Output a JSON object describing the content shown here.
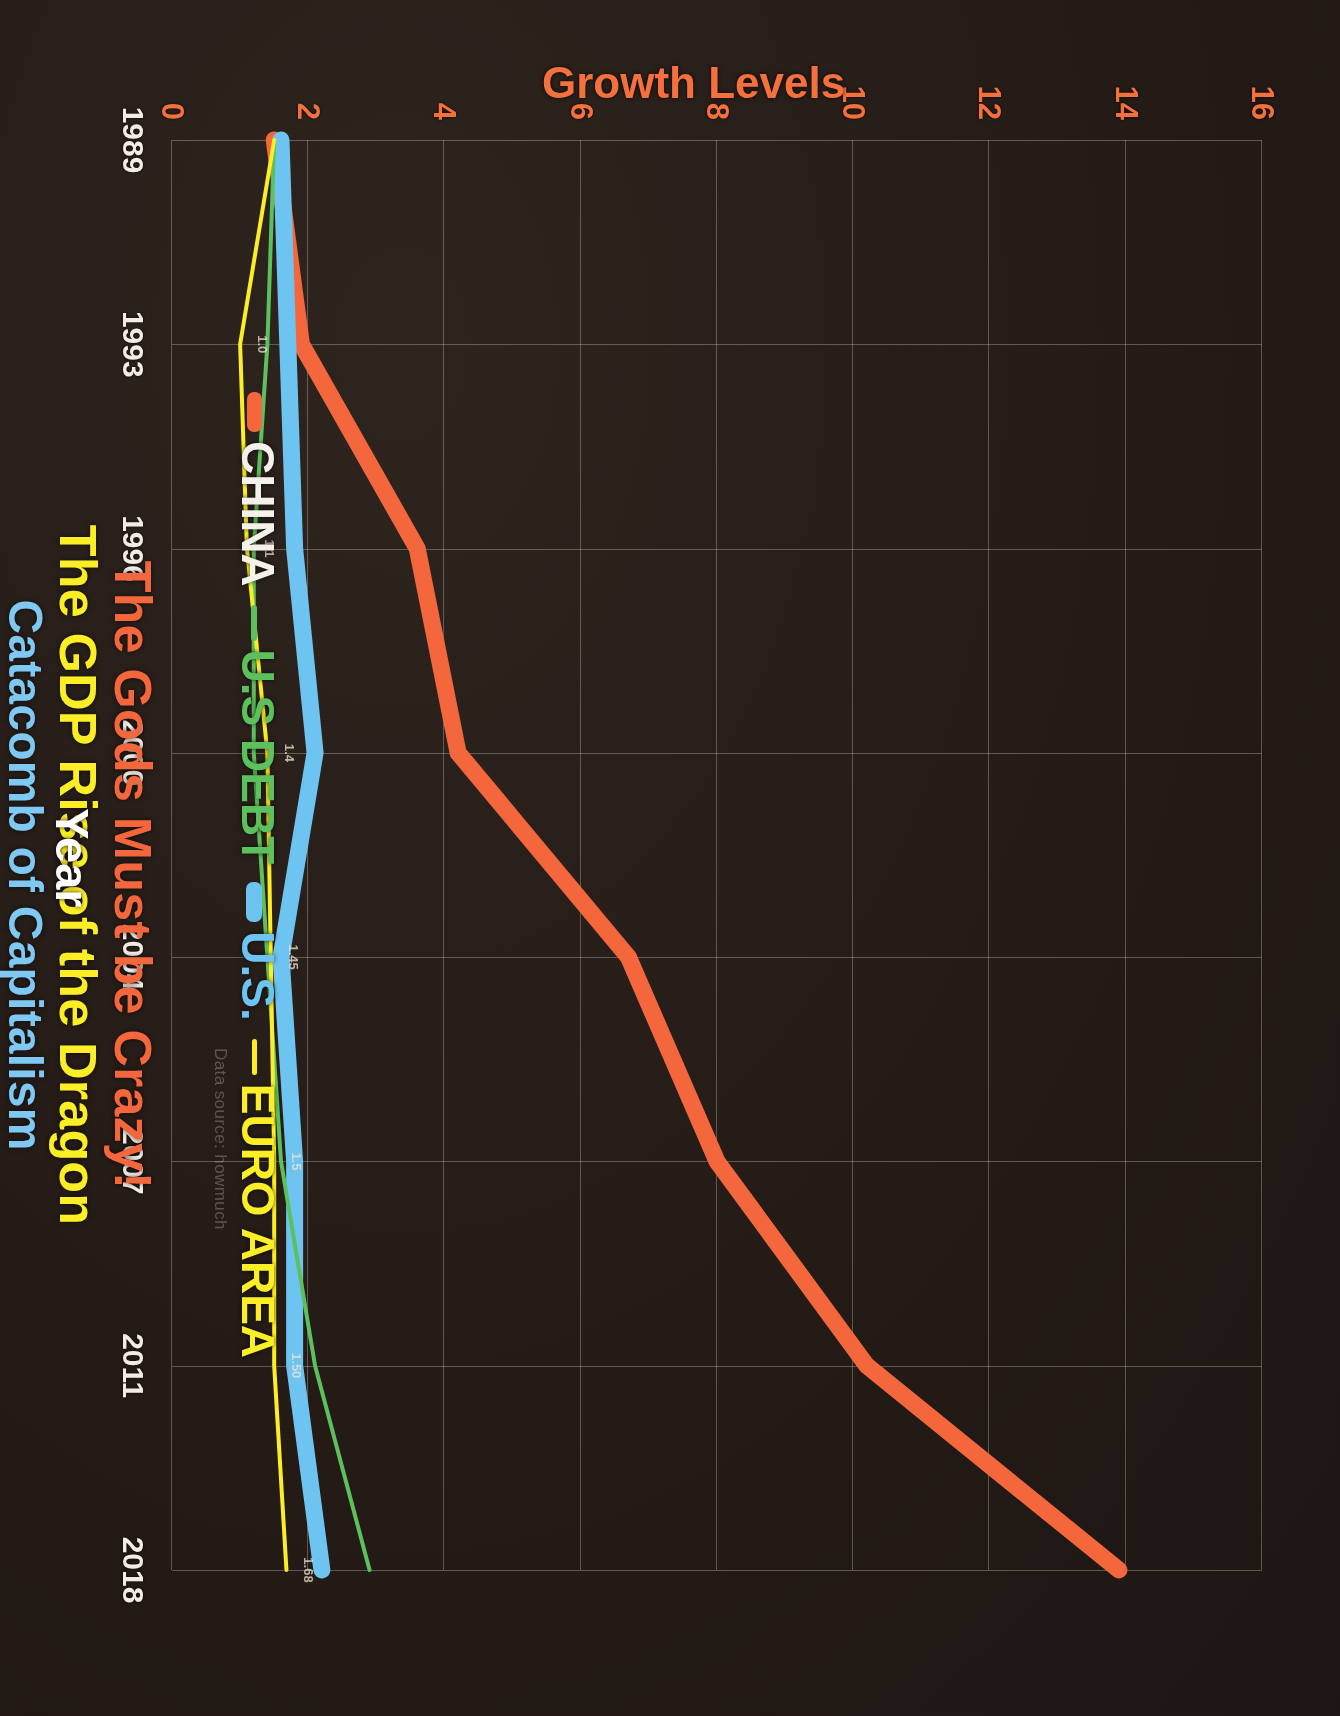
{
  "titles": {
    "line1": "The Gods Must be Crazy!",
    "line2": "The GDP Rise of the Dragon",
    "line3": "Catacomb of Capitalism"
  },
  "axes": {
    "x_title": "Year",
    "y_title": "Growth Levels"
  },
  "source_note": "Data source: howmuch",
  "legend": [
    {
      "label": "CHINA",
      "color": "#f4673c",
      "text_color": "#f4f0ea"
    },
    {
      "label": "U.S DEBT",
      "color": "#5cc15c",
      "text_color": "#5cc15c"
    },
    {
      "label": "U.S.",
      "color": "#6ec4f0",
      "text_color": "#6ec4f0"
    },
    {
      "label": "EURO AREA",
      "color": "#fbee26",
      "text_color": "#fbee26"
    }
  ],
  "colors": {
    "background": "#241b17",
    "grid": "#ebe4dc",
    "china": "#f4673c",
    "us_debt": "#5cc15c",
    "us": "#6ec4f0",
    "euro_area": "#fbee26",
    "y_tick": "#f4703c",
    "x_tick": "#f2ece5"
  },
  "data_labels": [
    {
      "text": "1.68",
      "series": "EURO AREA",
      "x_year": "2018"
    },
    {
      "text": "1.50",
      "series": "EURO AREA",
      "x_year": "2011"
    },
    {
      "text": "1.5",
      "series": "EURO AREA",
      "x_year": "2007"
    },
    {
      "text": "1.45",
      "series": "EURO AREA",
      "x_year": "2004"
    },
    {
      "text": "1.4",
      "series": "EURO AREA",
      "x_year": "2000"
    },
    {
      "text": "1.1",
      "series": "EURO AREA",
      "x_year": "1996"
    },
    {
      "text": "1.0",
      "series": "EURO AREA",
      "x_year": "1993"
    }
  ],
  "chart_data": {
    "type": "line",
    "xlabel": "Year",
    "ylabel": "Growth Levels",
    "categories": [
      "1989",
      "1993",
      "1996",
      "2000",
      "2004",
      "2007",
      "2011",
      "2018"
    ],
    "ylim": [
      0,
      16
    ],
    "yticks": [
      0,
      2,
      4,
      6,
      8,
      10,
      12,
      14,
      16
    ],
    "grid": true,
    "legend_position": "bottom",
    "series": [
      {
        "name": "CHINA",
        "color": "#f4673c",
        "width": "thick",
        "values": [
          1.5,
          1.9,
          3.6,
          4.2,
          6.7,
          8.0,
          10.2,
          13.9
        ]
      },
      {
        "name": "U.S DEBT",
        "color": "#5cc15c",
        "width": "thin",
        "values": [
          1.5,
          1.4,
          1.2,
          1.2,
          1.4,
          1.6,
          2.1,
          2.9
        ]
      },
      {
        "name": "U.S.",
        "color": "#6ec4f0",
        "width": "thick",
        "values": [
          1.6,
          1.7,
          1.8,
          2.1,
          1.6,
          1.8,
          1.8,
          2.2
        ]
      },
      {
        "name": "EURO AREA",
        "color": "#fbee26",
        "width": "thin",
        "values": [
          1.5,
          1.0,
          1.1,
          1.4,
          1.45,
          1.5,
          1.5,
          1.68
        ]
      }
    ]
  }
}
